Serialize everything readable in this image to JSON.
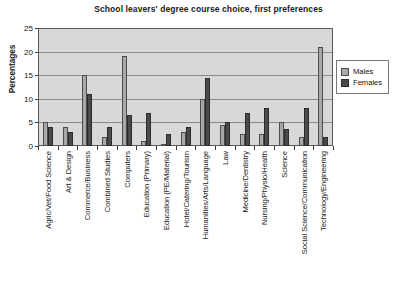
{
  "chart_data": {
    "type": "bar",
    "title": "School leavers' degree course choice, first preferences",
    "xlabel": "",
    "ylabel": "Percentages",
    "ylim": [
      0,
      25
    ],
    "yticks": [
      0,
      5,
      10,
      15,
      20,
      25
    ],
    "grid": true,
    "legend_position": "right",
    "categories": [
      "Agric/Vet/Food Science",
      "Art & Design",
      "Commerce/Business",
      "Combined Studies",
      "Computers",
      "Education (Primary)",
      "Education (PE/Material)",
      "Hotel/Catering/Tourism",
      "Humanities/Arts/Language",
      "Law",
      "Medicine/Dentistry",
      "Nursing/Physio/Health",
      "Science",
      "Social Science/Communication",
      "Technology/Engineering"
    ],
    "series": [
      {
        "name": "Males",
        "color": "#a8a8a8",
        "values": [
          5,
          4,
          15,
          2,
          19,
          1,
          0.5,
          3,
          10,
          4.5,
          2.5,
          2.5,
          5,
          2,
          21
        ]
      },
      {
        "name": "Females",
        "color": "#4a4a4a",
        "values": [
          4,
          3,
          11,
          4,
          6.5,
          7,
          2.5,
          4,
          14.5,
          5,
          7,
          8,
          3.5,
          8,
          2
        ]
      }
    ]
  },
  "legend": {
    "items": [
      {
        "label": "Males"
      },
      {
        "label": "Females"
      }
    ]
  }
}
